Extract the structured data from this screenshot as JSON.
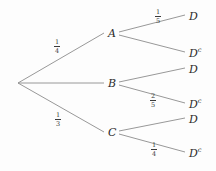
{
  "diagram": {
    "type": "probability-tree",
    "title": "",
    "root": {
      "label": ""
    },
    "line_color": "#8c8c8c",
    "text_color": "#2b2b2b",
    "branches": [
      {
        "node": "A",
        "probability": "1/4",
        "prob_num": "1",
        "prob_den": "4",
        "children": [
          {
            "leaf": "D",
            "leaf_base": "D",
            "leaf_sup": "",
            "probability": "1/5",
            "prob_num": "1",
            "prob_den": "5"
          },
          {
            "leaf": "Dc",
            "leaf_base": "D",
            "leaf_sup": "c",
            "probability": "",
            "prob_num": "",
            "prob_den": ""
          }
        ]
      },
      {
        "node": "B",
        "probability": "",
        "prob_num": "",
        "prob_den": "",
        "children": [
          {
            "leaf": "D",
            "leaf_base": "D",
            "leaf_sup": "",
            "probability": "",
            "prob_num": "",
            "prob_den": ""
          },
          {
            "leaf": "Dc",
            "leaf_base": "D",
            "leaf_sup": "c",
            "probability": "2/5",
            "prob_num": "2",
            "prob_den": "5"
          }
        ]
      },
      {
        "node": "C",
        "probability": "1/3",
        "prob_num": "1",
        "prob_den": "3",
        "children": [
          {
            "leaf": "D",
            "leaf_base": "D",
            "leaf_sup": "",
            "probability": "",
            "prob_num": "",
            "prob_den": ""
          },
          {
            "leaf": "Dc",
            "leaf_base": "D",
            "leaf_sup": "c",
            "probability": "1/4",
            "prob_num": "1",
            "prob_den": "4"
          }
        ]
      }
    ]
  }
}
